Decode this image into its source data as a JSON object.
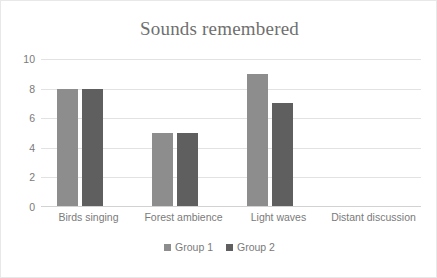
{
  "chart_data": {
    "type": "bar",
    "title": "Sounds remembered",
    "xlabel": "",
    "ylabel": "",
    "categories": [
      "Birds singing",
      "Forest ambience",
      "Light waves",
      "Distant discussion"
    ],
    "series": [
      {
        "name": "Group 1",
        "values": [
          8,
          5,
          9,
          0
        ],
        "color": "#8d8d8d"
      },
      {
        "name": "Group 2",
        "values": [
          8,
          5,
          7,
          0
        ],
        "color": "#5f5f5f"
      }
    ],
    "ylim": [
      0,
      10
    ],
    "ytick_step": 2,
    "ytick_labels": [
      "0",
      "2",
      "4",
      "6",
      "8",
      "10"
    ],
    "grid": true,
    "grid_axis": "y",
    "legend_position": "bottom-center",
    "title_color": "#6f6f6f",
    "axis_label_color": "#7a7a7a",
    "gridline_color": "#e2e2e2",
    "plot_background": "#ffffff",
    "border_color": "#e8e8e8"
  }
}
